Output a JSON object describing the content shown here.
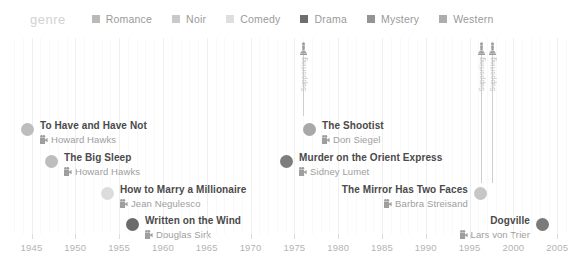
{
  "legend": {
    "title": "genre",
    "items": [
      {
        "label": "Romance",
        "color": "#b9b9b9"
      },
      {
        "label": "Noir",
        "color": "#c9c9c9"
      },
      {
        "label": "Comedy",
        "color": "#dedede"
      },
      {
        "label": "Drama",
        "color": "#6e6e6e"
      },
      {
        "label": "Mystery",
        "color": "#949494"
      },
      {
        "label": "Western",
        "color": "#adadad"
      }
    ]
  },
  "axis": {
    "label": "",
    "ticks": [
      "1945",
      "1950",
      "1955",
      "1960",
      "1965",
      "1970",
      "1975",
      "1980",
      "1985",
      "1990",
      "1995",
      "2000",
      "2005"
    ],
    "range": [
      1943,
      2006
    ]
  },
  "awards": [
    {
      "icon_name": "oscar-statuette-icon",
      "label": "Supporting",
      "x": 303,
      "line_top": 52,
      "line_bottom": 116
    },
    {
      "icon_name": "oscar-statuette-icon",
      "label": "Supporting",
      "x": 481,
      "line_top": 52,
      "line_bottom": 183
    },
    {
      "icon_name": "oscar-statuette-icon",
      "label": "Supporting",
      "x": 492,
      "line_top": 52,
      "line_bottom": 183
    }
  ],
  "films": [
    {
      "title": "To Have and Have Not",
      "director": "Howard Hawks",
      "color": "#bdbdbd",
      "dot_x": 21,
      "dot_y": 120,
      "align": "right"
    },
    {
      "title": "The Big Sleep",
      "director": "Howard Hawks",
      "color": "#bdbdbd",
      "dot_x": 45,
      "dot_y": 152,
      "align": "right"
    },
    {
      "title": "How to Marry a Millionaire",
      "director": "Jean Negulesco",
      "color": "#dcdcdc",
      "dot_x": 101,
      "dot_y": 184,
      "align": "right"
    },
    {
      "title": "Written on the Wind",
      "director": "Douglas Sirk",
      "color": "#6b6b6b",
      "dot_x": 126,
      "dot_y": 215,
      "align": "right"
    },
    {
      "title": "The Shootist",
      "director": "Don Siegel",
      "color": "#a8a8a8",
      "dot_x": 303,
      "dot_y": 120,
      "align": "right"
    },
    {
      "title": "Murder on the Orient Express",
      "director": "Sidney Lumet",
      "color": "#7d7d7d",
      "dot_x": 280,
      "dot_y": 152,
      "align": "right"
    },
    {
      "title": "The Mirror Has Two Faces",
      "director": "Barbra Streisand",
      "color": "#c6c6c6",
      "dot_x": 474,
      "dot_y": 184,
      "align": "left"
    },
    {
      "title": "Dogville",
      "director": "Lars von Trier",
      "color": "#7a7a7a",
      "dot_x": 536,
      "dot_y": 215,
      "align": "left"
    }
  ],
  "chart_data": {
    "type": "scatter",
    "title": "",
    "xlabel": "",
    "ylabel": "",
    "xlim": [
      1943,
      2006
    ],
    "grid": true,
    "legend_position": "top",
    "categories": [
      "Romance",
      "Noir",
      "Comedy",
      "Drama",
      "Mystery",
      "Western"
    ],
    "points": [
      {
        "label": "To Have and Have Not",
        "director": "Howard Hawks",
        "year": 1944,
        "genre": "Romance",
        "row": 1,
        "awards": []
      },
      {
        "label": "The Big Sleep",
        "director": "Howard Hawks",
        "year": 1946,
        "genre": "Noir",
        "row": 2,
        "awards": []
      },
      {
        "label": "How to Marry a Millionaire",
        "director": "Jean Negulesco",
        "year": 1953,
        "genre": "Comedy",
        "row": 3,
        "awards": []
      },
      {
        "label": "Written on the Wind",
        "director": "Douglas Sirk",
        "year": 1956,
        "genre": "Drama",
        "row": 4,
        "awards": []
      },
      {
        "label": "The Shootist",
        "director": "Don Siegel",
        "year": 1976,
        "genre": "Western",
        "row": 1,
        "awards": [
          "Supporting"
        ]
      },
      {
        "label": "Murder on the Orient Express",
        "director": "Sidney Lumet",
        "year": 1974,
        "genre": "Mystery",
        "row": 2,
        "awards": []
      },
      {
        "label": "The Mirror Has Two Faces",
        "director": "Barbra Streisand",
        "year": 1996,
        "genre": "Romance",
        "row": 3,
        "awards": [
          "Supporting",
          "Supporting"
        ]
      },
      {
        "label": "Dogville",
        "director": "Lars von Trier",
        "year": 2003,
        "genre": "Drama",
        "row": 4,
        "awards": []
      }
    ]
  }
}
